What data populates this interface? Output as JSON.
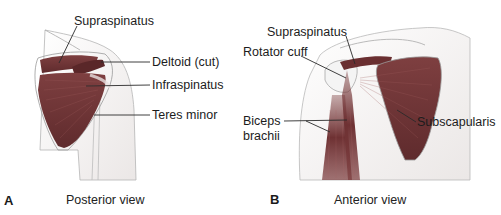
{
  "figure": {
    "panels": [
      {
        "letter": "A",
        "caption": "Posterior view",
        "labels": [
          "Supraspinatus",
          "Deltoid (cut)",
          "Infraspinatus",
          "Teres minor"
        ]
      },
      {
        "letter": "B",
        "caption": "Anterior view",
        "labels": [
          "Supraspinatus",
          "Rotator cuff",
          "Biceps",
          "brachii",
          "Subscapularis"
        ]
      }
    ],
    "colors": {
      "muscle": "#7b3b3c",
      "muscle_dark": "#5e2a2c",
      "skin": "#f2efee",
      "outline": "#9a9a9a",
      "leader": "#2a2a2a"
    }
  }
}
